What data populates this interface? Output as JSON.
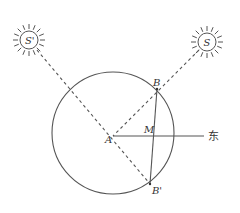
{
  "diagram": {
    "labels": {
      "sun_left": "S'",
      "sun_right": "S",
      "center": "A",
      "point_b": "B",
      "point_b_prime": "B'",
      "point_m": "M",
      "east": "东"
    },
    "colors": {
      "stroke": "#555555",
      "text": "#333333",
      "background": "#ffffff"
    }
  }
}
